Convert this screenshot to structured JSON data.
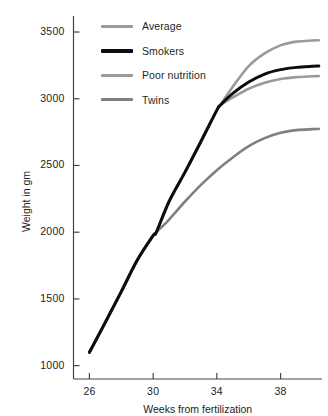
{
  "chart_data": {
    "type": "line",
    "title": "",
    "xlabel": "Weeks from fertilization",
    "ylabel": "Weight in gm",
    "xlim": [
      25.0,
      40.6
    ],
    "ylim": [
      900,
      3620
    ],
    "xticks": [
      26,
      30,
      34,
      38
    ],
    "yticks": [
      1000,
      1500,
      2000,
      2500,
      3000,
      3500
    ],
    "xtick_labels": [
      "26",
      "30",
      "34",
      "38"
    ],
    "ytick_labels": [
      "1000",
      "1500",
      "2000",
      "2500",
      "3000",
      "3500"
    ],
    "grid": false,
    "legend_position": "top-left-inside",
    "series": [
      {
        "name": "Average",
        "color": "#9a9a9a",
        "width": 2.6,
        "x": [
          26,
          27,
          28,
          29,
          30,
          30.2,
          31,
          32,
          33,
          34,
          34.2,
          35,
          36,
          37,
          38,
          39,
          40,
          40.4
        ],
        "y": [
          1100,
          1325,
          1555,
          1790,
          1975,
          2000,
          2230,
          2450,
          2680,
          2915,
          2950,
          3090,
          3245,
          3340,
          3400,
          3428,
          3436,
          3438
        ]
      },
      {
        "name": "Smokers",
        "color": "#0d0d0d",
        "width": 3.0,
        "x": [
          26,
          27,
          28,
          29,
          30,
          30.2,
          31,
          32,
          33,
          34,
          34.2,
          35,
          36,
          37,
          38,
          39,
          40,
          40.4
        ],
        "y": [
          1100,
          1325,
          1555,
          1790,
          1975,
          2000,
          2230,
          2450,
          2680,
          2915,
          2950,
          3040,
          3125,
          3185,
          3218,
          3235,
          3243,
          3245
        ]
      },
      {
        "name": "Poor nutrition",
        "color": "#9a9a9a",
        "width": 2.6,
        "x": [
          26,
          27,
          28,
          29,
          30,
          30.2,
          31,
          32,
          33,
          34,
          34.2,
          35,
          36,
          37,
          38,
          39,
          40,
          40.4
        ],
        "y": [
          1100,
          1325,
          1555,
          1790,
          1975,
          2000,
          2230,
          2450,
          2680,
          2915,
          2950,
          3010,
          3075,
          3120,
          3148,
          3162,
          3168,
          3170
        ]
      },
      {
        "name": "Twins",
        "color": "#808080",
        "width": 2.6,
        "x": [
          26,
          27,
          28,
          29,
          30,
          30.2,
          31,
          32,
          33,
          34,
          35,
          36,
          37,
          38,
          39,
          40,
          40.4
        ],
        "y": [
          1100,
          1325,
          1555,
          1790,
          1975,
          2000,
          2095,
          2230,
          2355,
          2465,
          2560,
          2645,
          2705,
          2745,
          2765,
          2772,
          2774
        ]
      }
    ]
  },
  "legend": {
    "items": [
      {
        "label": "Average",
        "color": "#9a9a9a"
      },
      {
        "label": "Smokers",
        "color": "#0d0d0d"
      },
      {
        "label": "Poor nutrition",
        "color": "#9a9a9a"
      },
      {
        "label": "Twins",
        "color": "#808080"
      }
    ]
  },
  "axes": {
    "y_title": "Weight in gm",
    "x_title": "Weeks from fertilization",
    "axis_color": "#444444"
  }
}
